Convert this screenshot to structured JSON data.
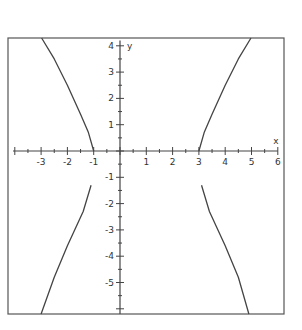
{
  "chart_data": {
    "type": "line",
    "title": "",
    "xlabel": "x",
    "ylabel": "y",
    "xlim": [
      -4.2,
      6.2
    ],
    "ylim": [
      -6.3,
      4.3
    ],
    "grid": false,
    "legend": null,
    "x_ticks": [
      -3,
      -2,
      -1,
      1,
      2,
      3,
      4,
      5,
      6
    ],
    "y_ticks": [
      4,
      3,
      2,
      1,
      -1,
      -2,
      -3,
      -4,
      -5
    ],
    "x_tick_labels": [
      "-3",
      "-2",
      "-1",
      "1",
      "2",
      "3",
      "4",
      "5",
      "6"
    ],
    "y_tick_labels": [
      "4",
      "3",
      "2",
      "1",
      "-1",
      "-2",
      "-3",
      "-4",
      "-5"
    ],
    "series": [
      {
        "name": "upper-left branch",
        "x": [
          -2.98,
          -2.5,
          -2.0,
          -1.5,
          -1.2,
          -1.0
        ],
        "y": [
          4.3,
          3.5,
          2.5,
          1.4,
          0.7,
          0.0
        ]
      },
      {
        "name": "lower-left branch",
        "x": [
          -1.1,
          -1.4,
          -2.0,
          -2.5,
          -3.0
        ],
        "y": [
          -1.3,
          -2.3,
          -3.6,
          -4.8,
          -6.3
        ]
      },
      {
        "name": "upper-right branch",
        "x": [
          3.0,
          3.2,
          3.5,
          4.0,
          4.5,
          4.98
        ],
        "y": [
          0.0,
          0.7,
          1.4,
          2.5,
          3.5,
          4.3
        ]
      },
      {
        "name": "lower-right branch",
        "x": [
          3.1,
          3.4,
          4.0,
          4.5,
          4.9
        ],
        "y": [
          -1.3,
          -2.3,
          -3.6,
          -4.8,
          -6.3
        ]
      }
    ],
    "colors": {
      "curve": "#444444",
      "axes": "#444444",
      "frame": "#555555"
    }
  }
}
